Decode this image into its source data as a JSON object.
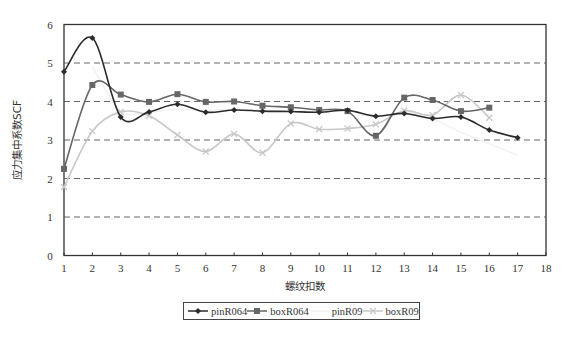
{
  "chart_data": {
    "type": "line",
    "title": "",
    "xlabel": "螺纹扣数",
    "ylabel": "应力集中系数SCF",
    "xlim": [
      1,
      18
    ],
    "ylim": [
      0,
      6
    ],
    "x_ticks": [
      "1",
      "2",
      "3",
      "4",
      "5",
      "6",
      "7",
      "8",
      "9",
      "10",
      "11",
      "12",
      "13",
      "14",
      "15",
      "16",
      "17",
      "18"
    ],
    "y_ticks": [
      "0",
      "1",
      "2",
      "3",
      "4",
      "5",
      "6"
    ],
    "grid": {
      "horizontal": true,
      "style": "dashed",
      "values": [
        1,
        2,
        3,
        4,
        5
      ]
    },
    "legend_position": "bottom",
    "series": [
      {
        "name": "pinR064",
        "color": "#2b2b2b",
        "marker": "diamond",
        "x": [
          1,
          2,
          3,
          4,
          5,
          6,
          7,
          8,
          9,
          10,
          11,
          12,
          13,
          14,
          15,
          16,
          17
        ],
        "values": [
          4.77,
          5.65,
          3.6,
          3.73,
          3.93,
          3.72,
          3.78,
          3.75,
          3.74,
          3.72,
          3.77,
          3.62,
          3.69,
          3.56,
          3.6,
          3.26,
          3.06
        ]
      },
      {
        "name": "boxR064",
        "color": "#666666",
        "marker": "square",
        "x": [
          1,
          2,
          3,
          4,
          5,
          6,
          7,
          8,
          9,
          10,
          11,
          12,
          13,
          14,
          15,
          16
        ],
        "values": [
          2.25,
          4.43,
          4.18,
          3.99,
          4.19,
          3.99,
          4.0,
          3.89,
          3.85,
          3.78,
          3.75,
          3.11,
          4.1,
          4.04,
          3.75,
          3.84
        ]
      },
      {
        "name": "pinR09",
        "color": "#f2f2f2",
        "marker": "none",
        "x": [
          2,
          3,
          4,
          5,
          6,
          7,
          8,
          9,
          10,
          11,
          12,
          13,
          14,
          15,
          16,
          17
        ],
        "values": [
          4.9,
          3.75,
          3.72,
          3.8,
          3.76,
          3.8,
          3.77,
          3.76,
          3.74,
          3.76,
          3.6,
          3.72,
          3.55,
          3.2,
          2.9,
          2.6
        ]
      },
      {
        "name": "boxR09",
        "color": "#c8c8c8",
        "marker": "x",
        "x": [
          1,
          2,
          3,
          4,
          5,
          6,
          7,
          8,
          9,
          10,
          11,
          12,
          13,
          14,
          15,
          16
        ],
        "values": [
          1.78,
          3.23,
          3.73,
          3.63,
          3.13,
          2.7,
          3.16,
          2.67,
          3.43,
          3.28,
          3.3,
          3.41,
          3.76,
          3.65,
          4.17,
          3.58
        ]
      }
    ]
  },
  "axes": {
    "xlabel": "螺纹扣数",
    "ylabel": "应力集中系数SCF"
  },
  "legend": {
    "items": [
      {
        "label": "pinR064"
      },
      {
        "label": "boxR064"
      },
      {
        "label": "pinR09"
      },
      {
        "label": "boxR09"
      }
    ]
  }
}
